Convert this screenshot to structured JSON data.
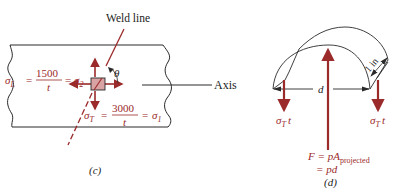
{
  "colors": {
    "stress_red": "#9b2a2a",
    "element_fill": "#d9a3a3",
    "line_black": "#2a2a2a",
    "background": "#ffffff"
  },
  "panel_c": {
    "caption": "(c)",
    "weld_line_label": "Weld line",
    "axis_label": "Axis",
    "angle_label": "θ",
    "sigma_L": {
      "lhs": "σ",
      "lhs_sub": "L",
      "eq1": "=",
      "numerator": "1500",
      "denominator": "t",
      "eq2": "=",
      "rhs": "σ",
      "rhs_sub": "2"
    },
    "sigma_T": {
      "lhs": "σ",
      "lhs_sub": "T",
      "eq1": "=",
      "numerator": "3000",
      "denominator": "t",
      "eq2": "=",
      "rhs": "σ",
      "rhs_sub": "1"
    }
  },
  "panel_d": {
    "caption": "(d)",
    "diameter_label": "d",
    "width_label": "1 in",
    "left_force": {
      "sym": "σ",
      "sub": "T",
      "suffix": "t"
    },
    "right_force": {
      "sym": "σ",
      "sub": "T",
      "suffix": "t"
    },
    "resultant_line1": {
      "lhs": "F = pA",
      "sub": "projected"
    },
    "resultant_line2": "= pd"
  }
}
